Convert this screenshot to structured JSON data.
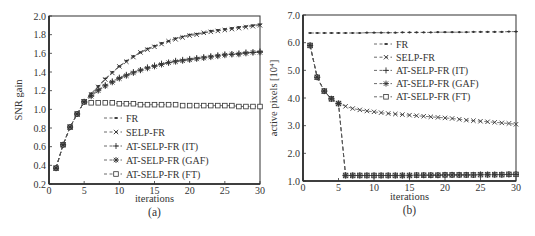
{
  "figure": {
    "panels": [
      "(a)",
      "(b)"
    ]
  },
  "chart_data": [
    {
      "panel_label": "(a)",
      "type": "line",
      "title": "",
      "xlabel": "iterations",
      "ylabel": "SNR gain",
      "xlim": [
        0,
        30
      ],
      "ylim": [
        0.2,
        2.0
      ],
      "xticks": [
        "0",
        "5",
        "10",
        "15",
        "20",
        "25",
        "30"
      ],
      "yticks": [
        "0.2",
        "0.4",
        "0.6",
        "0.8",
        "1.0",
        "1.2",
        "1.4",
        "1.6",
        "1.8",
        "2.0"
      ],
      "grid": false,
      "legend_position": "center (inside plot, lower-middle)",
      "x": [
        1,
        2,
        3,
        4,
        5,
        6,
        7,
        8,
        9,
        10,
        11,
        12,
        13,
        14,
        15,
        16,
        17,
        18,
        19,
        20,
        21,
        22,
        23,
        24,
        25,
        26,
        27,
        28,
        29,
        30
      ],
      "series": [
        {
          "name": "FR",
          "marker": "dot",
          "values": [
            0.37,
            0.62,
            0.81,
            0.95,
            1.08,
            1.17,
            1.25,
            1.33,
            1.4,
            1.46,
            1.52,
            1.57,
            1.61,
            1.65,
            1.68,
            1.71,
            1.73,
            1.76,
            1.78,
            1.8,
            1.81,
            1.82,
            1.84,
            1.85,
            1.86,
            1.87,
            1.88,
            1.89,
            1.9,
            1.91
          ]
        },
        {
          "name": "SELP-FR",
          "marker": "x",
          "values": [
            0.37,
            0.62,
            0.81,
            0.95,
            1.08,
            1.16,
            1.24,
            1.32,
            1.39,
            1.46,
            1.51,
            1.56,
            1.61,
            1.64,
            1.67,
            1.7,
            1.73,
            1.75,
            1.77,
            1.79,
            1.8,
            1.82,
            1.83,
            1.84,
            1.85,
            1.86,
            1.87,
            1.88,
            1.89,
            1.9
          ]
        },
        {
          "name": "AT-SELP-FR (IT)",
          "marker": "plus",
          "values": [
            0.37,
            0.62,
            0.81,
            0.95,
            1.08,
            1.15,
            1.21,
            1.26,
            1.3,
            1.34,
            1.37,
            1.4,
            1.42,
            1.45,
            1.47,
            1.49,
            1.5,
            1.52,
            1.53,
            1.54,
            1.55,
            1.56,
            1.57,
            1.58,
            1.59,
            1.59,
            1.6,
            1.61,
            1.61,
            1.62
          ]
        },
        {
          "name": "AT-SELP-FR (GAF)",
          "marker": "asterisk",
          "values": [
            0.37,
            0.62,
            0.81,
            0.95,
            1.08,
            1.14,
            1.2,
            1.25,
            1.29,
            1.33,
            1.36,
            1.39,
            1.42,
            1.44,
            1.46,
            1.48,
            1.5,
            1.51,
            1.52,
            1.53,
            1.54,
            1.55,
            1.56,
            1.57,
            1.58,
            1.59,
            1.59,
            1.6,
            1.61,
            1.61
          ]
        },
        {
          "name": "AT-SELP-FR (FT)",
          "marker": "square",
          "values": [
            0.37,
            0.62,
            0.81,
            0.95,
            1.08,
            1.07,
            1.07,
            1.07,
            1.07,
            1.06,
            1.06,
            1.06,
            1.05,
            1.05,
            1.05,
            1.05,
            1.05,
            1.05,
            1.04,
            1.04,
            1.04,
            1.04,
            1.04,
            1.04,
            1.04,
            1.04,
            1.03,
            1.03,
            1.03,
            1.03
          ]
        }
      ]
    },
    {
      "panel_label": "(b)",
      "type": "line",
      "title": "",
      "xlabel": "iterations",
      "ylabel": "active pixels [10⁴]",
      "xlim": [
        0,
        30
      ],
      "ylim": [
        1.0,
        7.0
      ],
      "xticks": [
        "0",
        "5",
        "10",
        "15",
        "20",
        "25",
        "30"
      ],
      "yticks": [
        "1.0",
        "2.0",
        "3.0",
        "4.0",
        "5.0",
        "6.0",
        "7.0"
      ],
      "grid": false,
      "legend_position": "upper center (inside plot)",
      "x": [
        1,
        2,
        3,
        4,
        5,
        6,
        7,
        8,
        9,
        10,
        11,
        12,
        13,
        14,
        15,
        16,
        17,
        18,
        19,
        20,
        21,
        22,
        23,
        24,
        25,
        26,
        27,
        28,
        29,
        30
      ],
      "series": [
        {
          "name": "FR",
          "marker": "dot",
          "values": [
            6.35,
            6.35,
            6.35,
            6.35,
            6.35,
            6.35,
            6.35,
            6.35,
            6.36,
            6.36,
            6.36,
            6.36,
            6.36,
            6.37,
            6.37,
            6.37,
            6.37,
            6.37,
            6.38,
            6.38,
            6.38,
            6.38,
            6.38,
            6.39,
            6.39,
            6.39,
            6.39,
            6.39,
            6.4,
            6.4
          ]
        },
        {
          "name": "SELP-FR",
          "marker": "x",
          "values": [
            5.9,
            4.75,
            4.25,
            3.97,
            3.8,
            3.7,
            3.62,
            3.57,
            3.53,
            3.5,
            3.47,
            3.44,
            3.42,
            3.4,
            3.38,
            3.36,
            3.34,
            3.32,
            3.3,
            3.28,
            3.26,
            3.23,
            3.2,
            3.18,
            3.16,
            3.14,
            3.12,
            3.1,
            3.08,
            3.05
          ]
        },
        {
          "name": "AT-SELP-FR (IT)",
          "marker": "plus",
          "values": [
            5.9,
            4.75,
            4.25,
            3.97,
            3.8,
            1.2,
            1.2,
            1.2,
            1.2,
            1.2,
            1.2,
            1.2,
            1.2,
            1.2,
            1.2,
            1.21,
            1.21,
            1.21,
            1.21,
            1.22,
            1.22,
            1.22,
            1.22,
            1.22,
            1.23,
            1.23,
            1.23,
            1.23,
            1.24,
            1.24
          ]
        },
        {
          "name": "AT-SELP-FR (GAF)",
          "marker": "asterisk",
          "values": [
            5.9,
            4.75,
            4.25,
            3.97,
            3.8,
            1.2,
            1.2,
            1.2,
            1.2,
            1.2,
            1.2,
            1.2,
            1.2,
            1.2,
            1.2,
            1.21,
            1.21,
            1.21,
            1.21,
            1.22,
            1.22,
            1.22,
            1.22,
            1.22,
            1.23,
            1.23,
            1.23,
            1.23,
            1.24,
            1.24
          ]
        },
        {
          "name": "AT-SELP-FR (FT)",
          "marker": "square",
          "values": [
            5.9,
            4.75,
            4.25,
            3.97,
            3.8,
            1.2,
            1.2,
            1.2,
            1.2,
            1.2,
            1.2,
            1.2,
            1.2,
            1.2,
            1.2,
            1.21,
            1.21,
            1.21,
            1.21,
            1.22,
            1.22,
            1.22,
            1.22,
            1.22,
            1.23,
            1.23,
            1.23,
            1.23,
            1.24,
            1.24
          ]
        }
      ]
    }
  ]
}
